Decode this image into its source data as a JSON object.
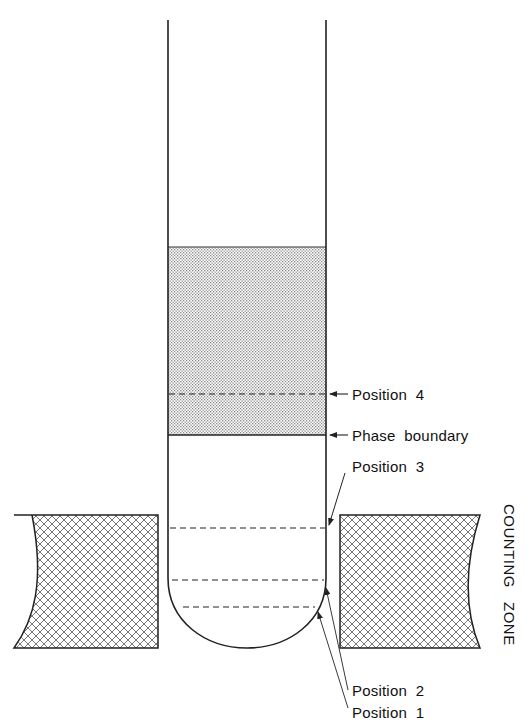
{
  "diagram": {
    "type": "counting-tube-schematic",
    "labels": {
      "position_4": "Position  4",
      "phase_boundary": "Phase  boundary",
      "position_3": "Position  3",
      "position_2": "Position  2",
      "position_1": "Position  1",
      "counting_zone": "COUNTING   ZONE"
    },
    "colors": {
      "line": "#222222",
      "stipple": "#9a9a9a",
      "crosshatch": "#6a6a6a",
      "background": "#ffffff"
    }
  }
}
